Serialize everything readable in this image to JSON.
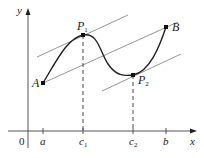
{
  "diagram": {
    "axes": {
      "x_label": "x",
      "y_label": "y",
      "origin_label": "0",
      "x_ticks": [
        {
          "label": "a",
          "sub": ""
        },
        {
          "label": "c",
          "sub": "1"
        },
        {
          "label": "c",
          "sub": "2"
        },
        {
          "label": "b",
          "sub": ""
        }
      ]
    },
    "points": [
      {
        "label": "A",
        "sub": ""
      },
      {
        "label": "P",
        "sub": "1"
      },
      {
        "label": "P",
        "sub": "2"
      },
      {
        "label": "B",
        "sub": ""
      }
    ],
    "lines": [
      "tangent at P1",
      "secant AB",
      "tangent at P2"
    ],
    "colors": {
      "curve": "#222222",
      "parallel_lines": "#8a8a8a",
      "axes": "#444444"
    }
  }
}
